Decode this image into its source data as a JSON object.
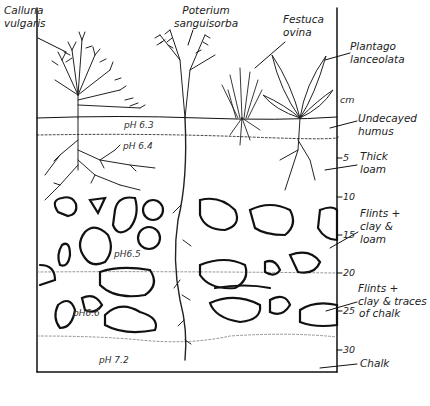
{
  "diagram": {
    "type": "soil-profile",
    "plants": [
      {
        "id": "calluna",
        "line1": "Calluna",
        "line2": "vulgaris"
      },
      {
        "id": "poterium",
        "line1": "Poterium",
        "line2": "sanguisorba"
      },
      {
        "id": "festuca",
        "line1": "Festuca",
        "line2": "ovina"
      },
      {
        "id": "plantago",
        "line1": "Plantago",
        "line2": "lanceolata"
      }
    ],
    "scale": {
      "unit": "cm",
      "ticks": [
        "5",
        "10",
        "15",
        "20",
        "25",
        "30"
      ]
    },
    "horizons": [
      {
        "id": "humus",
        "line1": "Undecayed",
        "line2": "humus"
      },
      {
        "id": "loam",
        "line1": "Thick",
        "line2": "loam"
      },
      {
        "id": "flints-loam",
        "line1": "Flints +",
        "line2": "clay & ",
        "line3": "loam"
      },
      {
        "id": "flints-chalk",
        "line1": "Flints +",
        "line2": "clay & traces",
        "line3": "of chalk"
      },
      {
        "id": "chalk",
        "line1": "Chalk"
      }
    ],
    "ph_values": [
      "pH 6.3",
      "pH 6.4",
      "pH6.5",
      "pH6.6",
      "pH 7.2"
    ]
  }
}
